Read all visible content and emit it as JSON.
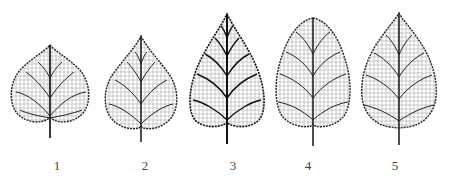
{
  "figure": {
    "ink_color": "#1a1a1a",
    "leaves": [
      {
        "label": "1",
        "shape": "broad cordate (heart-shaped), short tip"
      },
      {
        "label": "2",
        "shape": "ovate-cordate, pointed tip"
      },
      {
        "label": "3",
        "shape": "ovate, acuminate tip, dense dark veins"
      },
      {
        "label": "4",
        "shape": "ovate-elliptic, rounded tip"
      },
      {
        "label": "5",
        "shape": "ovate, acute tip"
      }
    ]
  }
}
